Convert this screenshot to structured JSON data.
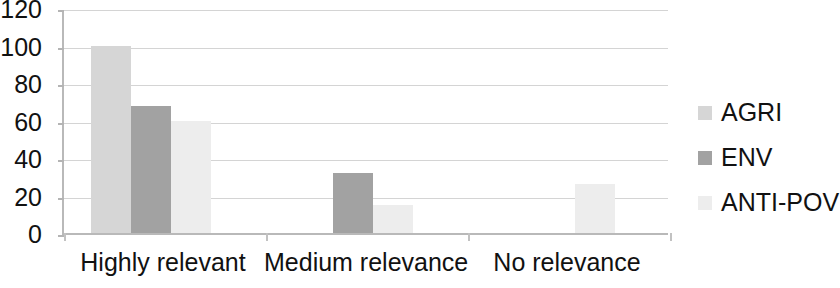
{
  "chart_data": {
    "type": "bar",
    "title": "",
    "subtitle": "",
    "xlabel": "",
    "ylabel": "",
    "categories": [
      "Highly relevant",
      "Medium relevance",
      "No relevance"
    ],
    "series": [
      {
        "name": "AGRI",
        "color": "#d6d6d6",
        "values": [
          100,
          0,
          0
        ]
      },
      {
        "name": "ENV",
        "color": "#a2a2a2",
        "values": [
          68,
          32,
          0
        ]
      },
      {
        "name": "ANTI-POV",
        "color": "#ededed",
        "values": [
          60,
          15,
          26
        ]
      }
    ],
    "ylim": [
      0,
      120
    ],
    "yticks": [
      0,
      20,
      40,
      60,
      80,
      100,
      120
    ],
    "ytick_labels": [
      "0",
      "20",
      "40",
      "60",
      "80",
      "100",
      "120"
    ],
    "grid": true,
    "grid_axis": "y",
    "legend_position": "right",
    "legend_entries": [
      "AGRI",
      "ENV",
      "ANTI-POV"
    ],
    "bar_style": "grouped",
    "background_color": "#ffffff",
    "axis_color": "#b9b9b9",
    "gridline_color": "#d4d4d4",
    "text_color": "#111111"
  }
}
